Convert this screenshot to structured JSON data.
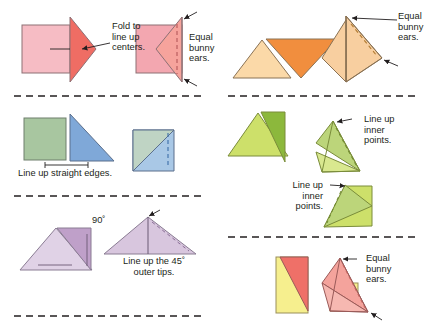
{
  "figure": {
    "background": "#ffffff",
    "divider_style": "dashed horizontal rule",
    "divider_color": "#231f20"
  },
  "colors": {
    "pink_light": "#f6bcc4",
    "pink_mid": "#f3a7b0",
    "salmon": "#ef6d64",
    "salmon_light": "#f6a39c",
    "peach_light": "#fbd9a8",
    "orange": "#f18e3e",
    "orange_light": "#f8cfa0",
    "green_sage": "#a8c6a0",
    "blue": "#7fa8d8",
    "blue_light": "#a9c8e6",
    "green_yellow": "#cde06a",
    "green_dark": "#8cb83c",
    "green_pale": "#d9e88f",
    "purple_light": "#d8c6de",
    "purple_mid": "#bfa0c9",
    "yellow": "#f6ef8e",
    "red_pink": "#ef7068",
    "stroke": "#6f6f6f",
    "stroke_dark": "#3a3a3a",
    "text": "#231f20"
  },
  "panels": [
    {
      "id": "panel-1",
      "name": "fold-to-line-up-centers",
      "labels": [
        {
          "id": "fold-centers",
          "text": "Fold to\nline up\ncenters.",
          "align": "left"
        },
        {
          "id": "equal-bunny-ears-1",
          "text": "Equal\nbunny\nears.",
          "align": "left"
        }
      ]
    },
    {
      "id": "panel-2",
      "name": "orange-bunny-ears",
      "labels": [
        {
          "id": "equal-bunny-ears-2",
          "text": "Equal\nbunny\nears.",
          "align": "left"
        }
      ]
    },
    {
      "id": "panel-3",
      "name": "line-up-straight-edges",
      "labels": [
        {
          "id": "line-up-straight-edges",
          "text": "Line up straight edges.",
          "align": "left"
        }
      ]
    },
    {
      "id": "panel-4",
      "name": "line-up-inner-points",
      "labels": [
        {
          "id": "line-up-inner-points-1",
          "text": "Line up\ninner\npoints.",
          "align": "left"
        },
        {
          "id": "line-up-inner-points-2",
          "text": "Line up\ninner\npoints.",
          "align": "right"
        }
      ]
    },
    {
      "id": "panel-5",
      "name": "line-up-45-outer-tips",
      "labels": [
        {
          "id": "angle-90",
          "text": "90˚",
          "align": "left"
        },
        {
          "id": "line-up-45-outer-tips",
          "text": "Line up the 45˚\nouter tips.",
          "align": "center"
        }
      ]
    },
    {
      "id": "panel-6",
      "name": "pink-bunny-ears",
      "labels": [
        {
          "id": "equal-bunny-ears-3",
          "text": "Equal\nbunny\nears.",
          "align": "left"
        }
      ]
    }
  ],
  "labels": {
    "fold_centers": "Fold to\nline up\ncenters.",
    "equal_bunny_ears_1": "Equal\nbunny\nears.",
    "equal_bunny_ears_2": "Equal\nbunny\nears.",
    "equal_bunny_ears_3": "Equal\nbunny\nears.",
    "line_up_straight_edges": "Line up straight edges.",
    "line_up_inner_points_1": "Line up\ninner\npoints.",
    "line_up_inner_points_2": "Line up\ninner\npoints.",
    "angle_90": "90˚",
    "line_up_45_outer_tips": "Line up the 45˚\nouter tips."
  }
}
